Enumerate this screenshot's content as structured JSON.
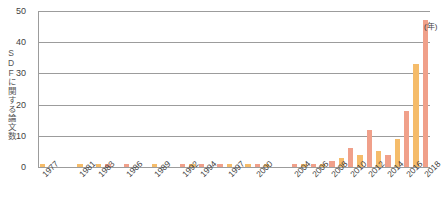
{
  "chart_data": {
    "type": "bar",
    "title": "",
    "xlabel": "(年)",
    "ylabel": "SDFに関する論文数",
    "ylim": [
      0,
      50
    ],
    "yticks": [
      0,
      10,
      20,
      30,
      40,
      50
    ],
    "grid": true,
    "legend": null,
    "x_axis_unit": "(年)",
    "categories": [
      "1977",
      "1978",
      "1979",
      "1980",
      "1981",
      "1982",
      "1983",
      "1984",
      "1985",
      "1986",
      "1987",
      "1988",
      "1989",
      "1990",
      "1991",
      "1992",
      "1993",
      "1994",
      "1995",
      "1996",
      "1997",
      "1998",
      "1999",
      "2000",
      "2001",
      "2002",
      "2003",
      "2004",
      "2005",
      "2006",
      "2007",
      "2008",
      "2009",
      "2010",
      "2011",
      "2012",
      "2013",
      "2014",
      "2015",
      "2016",
      "2017",
      "2018"
    ],
    "values": [
      1,
      0,
      0,
      0,
      1,
      0,
      1,
      1,
      0,
      1,
      0,
      0,
      1,
      0,
      0,
      1,
      1,
      1,
      0,
      1,
      1,
      0,
      1,
      1,
      1,
      0,
      0,
      1,
      1,
      1,
      1,
      2,
      3,
      6,
      4,
      12,
      5,
      4,
      9,
      18,
      33,
      47
    ],
    "labeled_ticks": [
      "1977",
      "1981",
      "1983",
      "1986",
      "1989",
      "1992",
      "1994",
      "1997",
      "2000",
      "2004",
      "2006",
      "2008",
      "2010",
      "2012",
      "2014",
      "2016",
      "2018"
    ],
    "colors": {
      "bar_odd": "#f0a08a",
      "bar_even": "#f5bc6a",
      "gridline": "#9c9c9c",
      "text": "#3f3f3f",
      "background": "#ffffff"
    }
  }
}
